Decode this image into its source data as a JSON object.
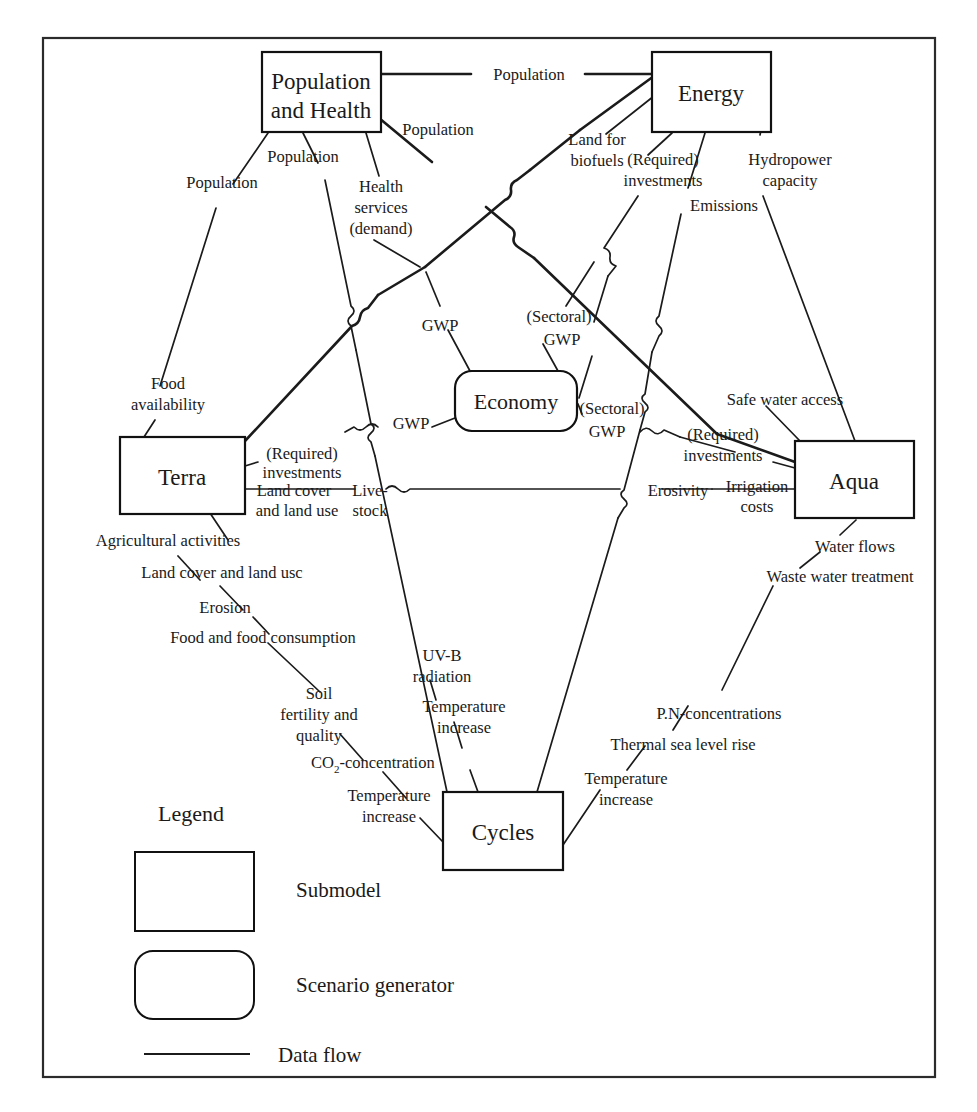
{
  "diagram": {
    "nodes": [
      {
        "id": "population_health",
        "label_line1": "Population",
        "label_line2": "and Health",
        "shape": "rect",
        "type": "submodel"
      },
      {
        "id": "energy",
        "label_line1": "Energy",
        "label_line2": "",
        "shape": "rect",
        "type": "submodel"
      },
      {
        "id": "terra",
        "label_line1": "Terra",
        "label_line2": "",
        "shape": "rect",
        "type": "submodel"
      },
      {
        "id": "aqua",
        "label_line1": "Aqua",
        "label_line2": "",
        "shape": "rect",
        "type": "submodel"
      },
      {
        "id": "cycles",
        "label_line1": "Cycles",
        "label_line2": "",
        "shape": "rect",
        "type": "submodel"
      },
      {
        "id": "economy",
        "label_line1": "Economy",
        "label_line2": "",
        "shape": "rounded-rect",
        "type": "scenario-generator"
      }
    ],
    "edge_labels": {
      "pop_to_energy": "Population",
      "pop_left_to_terra": "Population",
      "pop_mid_to_cycles": "Population",
      "pop_to_economy_right": "Population",
      "health_services_demand_l1": "Health",
      "health_services_demand_l2": "services",
      "health_services_demand_l3": "(demand)",
      "land_for_biofuels_l1": "Land for",
      "land_for_biofuels_l2": "biofuels",
      "energy_required_investments_l1": "(Required)",
      "energy_required_investments_l2": "investments",
      "emissions": "Emissions",
      "hydropower_capacity_l1": "Hydropower",
      "hydropower_capacity_l2": "capacity",
      "food_availability_l1": "Food",
      "food_availability_l2": "availability",
      "gwp_upper": "GWP",
      "sectoral_gwp_upper_l1": "(Sectoral)",
      "sectoral_gwp_upper_l2": "GWP",
      "gwp_left": "GWP",
      "sectoral_gwp_right_l1": "(Sectoral)",
      "sectoral_gwp_right_l2": "GWP",
      "safe_water_access": "Safe water access",
      "aqua_required_investments_l1": "(Required)",
      "aqua_required_investments_l2": "investments",
      "terra_required_investments_l1": "(Required)",
      "terra_required_investments_l2": "investments",
      "land_cover_and_land_use_l1": "Land cover",
      "land_cover_and_land_use_l2": "and land use",
      "livestock_l1": "Live-",
      "livestock_l2": "stock",
      "erosivity": "Erosivity",
      "irrigation_costs_l1": "Irrigation",
      "irrigation_costs_l2": "costs",
      "agricultural_activities": "Agricultural activities",
      "land_cover_and_land_use_chain": "Land cover and land usc",
      "erosion": "Erosion",
      "food_and_food_consumption": "Food and food consumption",
      "soil_fertility_quality_l1": "Soil",
      "soil_fertility_quality_l2": "fertility and",
      "soil_fertility_quality_l3": "quality",
      "co2_concentration_pre": "CO",
      "co2_concentration_sub": "2",
      "co2_concentration_post": "-concentration",
      "temperature_increase_left_l1": "Temperature",
      "temperature_increase_left_l2": "increase",
      "uvb_radiation_l1": "UV-B",
      "uvb_radiation_l2": "radiation",
      "temperature_increase_mid_l1": "Temperature",
      "temperature_increase_mid_l2": "increase",
      "water_flows": "Water flows",
      "waste_water_treatment": "Waste water treatment",
      "pn_concentrations": "P.N-concentrations",
      "thermal_sea_level_rise": "Thermal sea level rise",
      "temperature_increase_right_l1": "Temperature",
      "temperature_increase_right_l2": "increase"
    },
    "legend": {
      "title": "Legend",
      "items": [
        {
          "key": "submodel",
          "label": "Submodel",
          "symbol": "rectangle"
        },
        {
          "key": "scenario_generator",
          "label": "Scenario generator",
          "symbol": "rounded-rectangle"
        },
        {
          "key": "data_flow",
          "label": "Data flow",
          "symbol": "line"
        }
      ]
    },
    "colors": {
      "stroke": "#1b1b1b",
      "frame": "#2b2b2b",
      "background": "#ffffff",
      "text": "#1a1a1a"
    }
  }
}
